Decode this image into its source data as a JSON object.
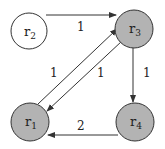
{
  "nodes": [
    {
      "id": "r1",
      "base": "r",
      "sub": "1",
      "fill": "#b3b3b3"
    },
    {
      "id": "r2",
      "base": "r",
      "sub": "2",
      "fill": "#ffffff"
    },
    {
      "id": "r3",
      "base": "r",
      "sub": "3",
      "fill": "#b3b3b3"
    },
    {
      "id": "r4",
      "base": "r",
      "sub": "4",
      "fill": "#b3b3b3"
    }
  ],
  "edges": [
    {
      "from": "r2",
      "to": "r3",
      "weight": "1"
    },
    {
      "from": "r1",
      "to": "r3",
      "weight": "1"
    },
    {
      "from": "r3",
      "to": "r1",
      "weight": "1"
    },
    {
      "from": "r3",
      "to": "r4",
      "weight": "1"
    },
    {
      "from": "r4",
      "to": "r1",
      "weight": "2"
    }
  ]
}
